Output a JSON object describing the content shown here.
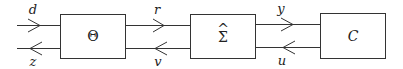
{
  "diagram": {
    "blocks": [
      {
        "id": "theta",
        "label": "Θ"
      },
      {
        "id": "sigma_hat",
        "label": "Σ",
        "accent": "^"
      },
      {
        "id": "controller",
        "label": "C"
      }
    ],
    "signals": {
      "d": "d",
      "z": "z",
      "r": "r",
      "v": "v",
      "y": "y",
      "u": "u"
    },
    "colors": {
      "stroke": "#333333",
      "background": "#ffffff"
    }
  }
}
